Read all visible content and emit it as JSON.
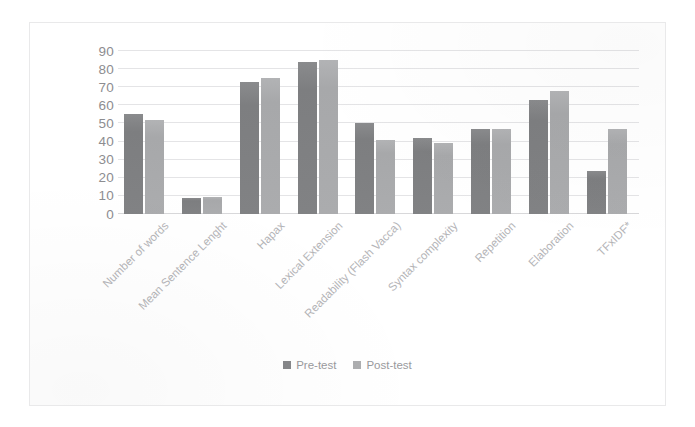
{
  "chart_data": {
    "type": "bar",
    "title": "",
    "subtitle": "",
    "xlabel": "",
    "ylabel": "",
    "ylim": [
      0,
      90
    ],
    "yticks": [
      0,
      10,
      20,
      30,
      40,
      50,
      60,
      70,
      80,
      90
    ],
    "ytick_labels": [
      "0",
      "10",
      "20",
      "30",
      "40",
      "50",
      "60",
      "70",
      "80",
      "90"
    ],
    "grid": "horizontal",
    "legend_position": "bottom-center",
    "x_label_rotation": -45,
    "categories": [
      "Number of words",
      "Mean Sentence Lenght",
      "Hapax",
      "Lexical Extension",
      "Readability (Flash Vacca)",
      "Syntax complexity",
      "Repetition",
      "Elaboration",
      "TFxIDF*"
    ],
    "series": [
      {
        "name": "Pre-test",
        "color": "#7f8082",
        "values": [
          55,
          9,
          73,
          84,
          50,
          42,
          47,
          63,
          24
        ]
      },
      {
        "name": "Post-test",
        "color": "#a9aaac",
        "values": [
          52,
          9.5,
          75,
          85,
          41,
          39,
          47,
          68,
          47
        ]
      }
    ],
    "annotations": []
  },
  "legend": {
    "items": [
      {
        "label": "Pre-test",
        "swatch": "pre"
      },
      {
        "label": "Post-test",
        "swatch": "post"
      }
    ]
  }
}
